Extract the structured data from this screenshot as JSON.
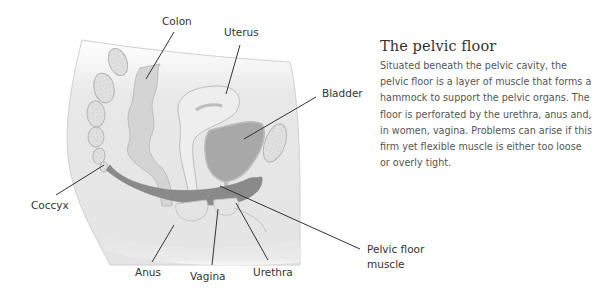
{
  "panel": {
    "title": "The pelvic floor",
    "body": "Situated beneath the pelvic cavity, the pelvic floor is a layer of muscle that forms a hammock to support the pelvic organs. The floor is perforated by the urethra, anus and, in women, vagina. Problems can arise if this firm yet flexible muscle is either too loose or overly tight."
  },
  "labels": {
    "colon": "Colon",
    "uterus": "Uterus",
    "bladder": "Bladder",
    "coccyx": "Coccyx",
    "anus": "Anus",
    "vagina": "Vagina",
    "urethra": "Urethra",
    "pelvic_floor_muscle_line1": "Pelvic floor",
    "pelvic_floor_muscle_line2": "muscle"
  },
  "colors": {
    "muscle": "#8a8a8a",
    "tissue": "#e6e6e6",
    "organ_dark": "#a8a8a8",
    "outline": "#bdbdbd",
    "leader": "#333333"
  }
}
